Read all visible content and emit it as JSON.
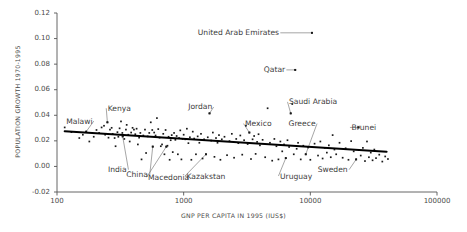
{
  "chart_data": {
    "type": "scatter",
    "title": "",
    "xlabel": "GNP PER CAPITA IN 1995 (IUS$)",
    "ylabel": "POPULATION GROWTH 1970-1995",
    "xscale": "log",
    "yscale": "linear",
    "xlim": [
      100,
      100000
    ],
    "ylim": [
      -0.02,
      0.12
    ],
    "grid": false,
    "legend": null,
    "xticks": [
      100,
      1000,
      10000,
      100000
    ],
    "xtick_labels": [
      "100",
      "1000",
      "10000",
      "100000"
    ],
    "yticks": [
      -0.02,
      0.0,
      0.02,
      0.04,
      0.06,
      0.08,
      0.1,
      0.12
    ],
    "ytick_labels": [
      "-0.02",
      "0.00",
      "0.02",
      "0.04",
      "0.06",
      "0.08",
      "0.10",
      "0.12"
    ],
    "marker_color": "#1a1a1a",
    "trendline": {
      "label": "linear fit (log x)",
      "color": "#000000",
      "width": 2.0,
      "x": [
        115,
        40000
      ],
      "y": [
        0.0275,
        0.0115
      ]
    },
    "annotations": [
      {
        "text": "Malawi",
        "x": 150,
        "y": 0.0355,
        "point_x": 170,
        "point_y": 0.0272
      },
      {
        "text": "Kenya",
        "x": 310,
        "y": 0.0455,
        "point_x": 250,
        "point_y": 0.0345
      },
      {
        "text": "India",
        "x": 300,
        "y": -0.0025,
        "point_x": 330,
        "point_y": 0.0235
      },
      {
        "text": "China",
        "x": 430,
        "y": -0.0065,
        "point_x": 570,
        "point_y": 0.0155
      },
      {
        "text": "Macedonia",
        "x": 760,
        "y": -0.0085,
        "point_x": 730,
        "point_y": 0.0155
      },
      {
        "text": "Kazakstan",
        "x": 1500,
        "y": -0.0075,
        "point_x": 1500,
        "point_y": 0.0095
      },
      {
        "text": "Jordan",
        "x": 1350,
        "y": 0.0465,
        "point_x": 1600,
        "point_y": 0.0415
      },
      {
        "text": "Mexico",
        "x": 3900,
        "y": 0.0335,
        "point_x": 3300,
        "point_y": 0.0265
      },
      {
        "text": "Saudi Arabia",
        "x": 10500,
        "y": 0.0505,
        "point_x": 7000,
        "point_y": 0.0415
      },
      {
        "text": "Qatar",
        "x": 5200,
        "y": 0.0755,
        "point_x": 7600,
        "point_y": 0.0755
      },
      {
        "text": "United Arab Emirates",
        "x": 2700,
        "y": 0.1045,
        "point_x": 10300,
        "point_y": 0.1045
      },
      {
        "text": "Greece",
        "x": 8600,
        "y": 0.0335,
        "point_x": 9200,
        "point_y": 0.0095
      },
      {
        "text": "Uruguay",
        "x": 7700,
        "y": -0.0075,
        "point_x": 6400,
        "point_y": 0.0065
      },
      {
        "text": "Sweden",
        "x": 15000,
        "y": -0.0025,
        "point_x": 23000,
        "point_y": 0.0055
      },
      {
        "text": "Brunei",
        "x": 26500,
        "y": 0.0305,
        "point_x": 24000,
        "point_y": 0.0305
      }
    ],
    "points": [
      [
        115,
        0.0305
      ],
      [
        130,
        0.0268
      ],
      [
        150,
        0.0222
      ],
      [
        160,
        0.0248
      ],
      [
        170,
        0.0272
      ],
      [
        180,
        0.0195
      ],
      [
        195,
        0.0232
      ],
      [
        205,
        0.0285
      ],
      [
        215,
        0.0262
      ],
      [
        225,
        0.0305
      ],
      [
        235,
        0.0318
      ],
      [
        240,
        0.0248
      ],
      [
        250,
        0.0345
      ],
      [
        255,
        0.0225
      ],
      [
        262,
        0.0288
      ],
      [
        270,
        0.0302
      ],
      [
        275,
        0.0255
      ],
      [
        285,
        0.0222
      ],
      [
        290,
        0.0158
      ],
      [
        300,
        0.0268
      ],
      [
        305,
        0.0232
      ],
      [
        312,
        0.0298
      ],
      [
        320,
        0.0352
      ],
      [
        328,
        0.0262
      ],
      [
        330,
        0.0235
      ],
      [
        340,
        0.0215
      ],
      [
        350,
        0.0288
      ],
      [
        355,
        0.0325
      ],
      [
        365,
        0.0248
      ],
      [
        375,
        0.0195
      ],
      [
        385,
        0.0265
      ],
      [
        395,
        0.0302
      ],
      [
        405,
        0.0288
      ],
      [
        415,
        0.0252
      ],
      [
        425,
        0.0295
      ],
      [
        435,
        0.0172
      ],
      [
        445,
        0.0225
      ],
      [
        455,
        0.0262
      ],
      [
        465,
        0.0055
      ],
      [
        480,
        0.0242
      ],
      [
        495,
        0.0288
      ],
      [
        505,
        0.0105
      ],
      [
        520,
        0.0235
      ],
      [
        535,
        0.0262
      ],
      [
        550,
        0.0345
      ],
      [
        565,
        0.0285
      ],
      [
        570,
        0.0155
      ],
      [
        585,
        0.0265
      ],
      [
        600,
        0.0242
      ],
      [
        615,
        0.0378
      ],
      [
        630,
        0.0292
      ],
      [
        645,
        0.0225
      ],
      [
        660,
        0.0158
      ],
      [
        675,
        0.0172
      ],
      [
        690,
        0.0255
      ],
      [
        705,
        0.0095
      ],
      [
        720,
        0.0285
      ],
      [
        730,
        0.0155
      ],
      [
        745,
        0.0162
      ],
      [
        760,
        0.0232
      ],
      [
        775,
        0.0052
      ],
      [
        790,
        0.0205
      ],
      [
        805,
        0.0245
      ],
      [
        820,
        0.0112
      ],
      [
        840,
        0.0262
      ],
      [
        860,
        0.0208
      ],
      [
        880,
        0.0238
      ],
      [
        900,
        0.0095
      ],
      [
        920,
        0.0222
      ],
      [
        940,
        0.0282
      ],
      [
        960,
        0.0055
      ],
      [
        980,
        0.0215
      ],
      [
        1000,
        0.0248
      ],
      [
        1030,
        0.0212
      ],
      [
        1060,
        0.0295
      ],
      [
        1090,
        0.0182
      ],
      [
        1120,
        0.0228
      ],
      [
        1150,
        0.0052
      ],
      [
        1180,
        0.0272
      ],
      [
        1210,
        0.0218
      ],
      [
        1250,
        0.0095
      ],
      [
        1290,
        0.0235
      ],
      [
        1330,
        0.0185
      ],
      [
        1370,
        0.0255
      ],
      [
        1410,
        0.0062
      ],
      [
        1450,
        0.0212
      ],
      [
        1500,
        0.0095
      ],
      [
        1550,
        0.0228
      ],
      [
        1600,
        0.0415
      ],
      [
        1650,
        0.0202
      ],
      [
        1700,
        0.0265
      ],
      [
        1750,
        0.0075
      ],
      [
        1800,
        0.0222
      ],
      [
        1850,
        0.0185
      ],
      [
        1900,
        0.0245
      ],
      [
        1950,
        0.0052
      ],
      [
        2000,
        0.0212
      ],
      [
        2100,
        0.0232
      ],
      [
        2200,
        0.0088
      ],
      [
        2300,
        0.0198
      ],
      [
        2400,
        0.0255
      ],
      [
        2500,
        0.0068
      ],
      [
        2600,
        0.0215
      ],
      [
        2700,
        0.0182
      ],
      [
        2800,
        0.0242
      ],
      [
        2900,
        0.0092
      ],
      [
        3000,
        0.0205
      ],
      [
        3100,
        0.0318
      ],
      [
        3200,
        0.0175
      ],
      [
        3300,
        0.0265
      ],
      [
        3400,
        0.0058
      ],
      [
        3500,
        0.0212
      ],
      [
        3600,
        0.0238
      ],
      [
        3700,
        0.0098
      ],
      [
        3800,
        0.0192
      ],
      [
        3900,
        0.0252
      ],
      [
        4000,
        0.0165
      ],
      [
        4200,
        0.0208
      ],
      [
        4400,
        0.0072
      ],
      [
        4600,
        0.0455
      ],
      [
        4800,
        0.0185
      ],
      [
        5000,
        0.0045
      ],
      [
        5200,
        0.0215
      ],
      [
        5400,
        0.0158
      ],
      [
        5600,
        0.0055
      ],
      [
        5800,
        0.0195
      ],
      [
        6000,
        0.0118
      ],
      [
        6200,
        0.0172
      ],
      [
        6400,
        0.0065
      ],
      [
        6600,
        0.0205
      ],
      [
        6800,
        0.0152
      ],
      [
        7000,
        0.0415
      ],
      [
        7200,
        0.0488
      ],
      [
        7400,
        0.0095
      ],
      [
        7600,
        0.0755
      ],
      [
        7800,
        0.0138
      ],
      [
        8000,
        0.0185
      ],
      [
        8400,
        0.0055
      ],
      [
        8800,
        0.0162
      ],
      [
        9200,
        0.0095
      ],
      [
        9600,
        0.0148
      ],
      [
        10000,
        0.0052
      ],
      [
        10300,
        0.1045
      ],
      [
        10800,
        0.0178
      ],
      [
        11500,
        0.0085
      ],
      [
        12000,
        0.0195
      ],
      [
        12500,
        0.0062
      ],
      [
        13000,
        0.0145
      ],
      [
        13500,
        0.0108
      ],
      [
        14000,
        0.0165
      ],
      [
        14500,
        0.0072
      ],
      [
        15000,
        0.0245
      ],
      [
        15500,
        0.0132
      ],
      [
        16000,
        0.0095
      ],
      [
        17000,
        0.0185
      ],
      [
        18000,
        0.0068
      ],
      [
        19000,
        0.0142
      ],
      [
        20000,
        0.0052
      ],
      [
        21000,
        0.0198
      ],
      [
        22000,
        0.0118
      ],
      [
        23000,
        0.0055
      ],
      [
        24000,
        0.0305
      ],
      [
        25000,
        0.0085
      ],
      [
        26000,
        0.0145
      ],
      [
        27000,
        0.0042
      ],
      [
        28000,
        0.0195
      ],
      [
        29000,
        0.0072
      ],
      [
        30000,
        0.0108
      ],
      [
        31000,
        0.0048
      ],
      [
        32000,
        0.0132
      ],
      [
        33000,
        0.0065
      ],
      [
        35000,
        0.0092
      ],
      [
        37000,
        0.0038
      ],
      [
        39000,
        0.0078
      ],
      [
        41000,
        0.0058
      ]
    ]
  }
}
